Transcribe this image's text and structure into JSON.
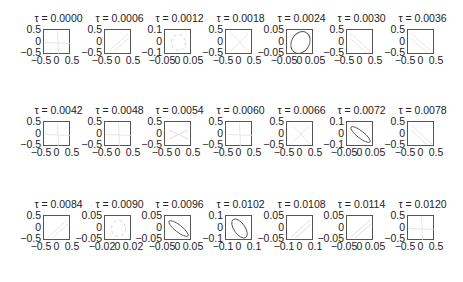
{
  "chart_data": {
    "type": "scatter",
    "layout": {
      "rows": 3,
      "cols": 7,
      "grid": false,
      "legend": "none"
    },
    "panels": [
      {
        "title": "τ = 0.0000",
        "xlim": [
          -0.5,
          0.5
        ],
        "ylim": [
          -0.5,
          0.5
        ],
        "xticks": [
          "−0.5",
          "0",
          "0.5"
        ],
        "yticks": [
          "0.5",
          "0",
          "−0.5"
        ],
        "shape": "faint-cross",
        "stroke": "#dddddd"
      },
      {
        "title": "τ = 0.0006",
        "xlim": [
          -0.5,
          0.5
        ],
        "ylim": [
          -0.5,
          0.5
        ],
        "xticks": [
          "−0.5",
          "0",
          "0.5"
        ],
        "yticks": [
          "0.5",
          "0",
          "−0.5"
        ],
        "shape": "faint-diagonal",
        "stroke": "#dddddd"
      },
      {
        "title": "τ = 0.0012",
        "xlim": [
          -0.05,
          0.05
        ],
        "ylim": [
          -0.1,
          0.1
        ],
        "xticks": [
          "−0.05",
          "0",
          "0.05"
        ],
        "yticks": [
          "0.1",
          "0",
          "−0.1"
        ],
        "shape": "faint-ring",
        "stroke": "#d0d0d0"
      },
      {
        "title": "τ = 0.0018",
        "xlim": [
          -0.5,
          0.5
        ],
        "ylim": [
          -0.5,
          0.5
        ],
        "xticks": [
          "−0.5",
          "0",
          "0.5"
        ],
        "yticks": [
          "0.5",
          "0",
          "−0.5"
        ],
        "shape": "faint-x",
        "stroke": "#dddddd"
      },
      {
        "title": "τ = 0.0024",
        "xlim": [
          -0.05,
          0.05
        ],
        "ylim": [
          -0.05,
          0.05
        ],
        "xticks": [
          "−0.05",
          "0",
          "0.05"
        ],
        "yticks": [
          "0.05",
          "0",
          "−0.05"
        ],
        "shape": "ellipse-tilt-right-large",
        "stroke": "#555555"
      },
      {
        "title": "τ = 0.0030",
        "xlim": [
          -0.5,
          0.5
        ],
        "ylim": [
          -0.5,
          0.5
        ],
        "xticks": [
          "−0.5",
          "0",
          "0.5"
        ],
        "yticks": [
          "0.5",
          "0",
          "−0.5"
        ],
        "shape": "faint-diagonal-down",
        "stroke": "#dddddd"
      },
      {
        "title": "τ = 0.0036",
        "xlim": [
          -0.5,
          0.5
        ],
        "ylim": [
          -0.5,
          0.5
        ],
        "xticks": [
          "−0.5",
          "0",
          "0.5"
        ],
        "yticks": [
          "0.5",
          "0",
          "−0.5"
        ],
        "shape": "faint-diagonal-down",
        "stroke": "#dddddd"
      },
      {
        "title": "τ = 0.0042",
        "xlim": [
          -0.5,
          0.5
        ],
        "ylim": [
          -0.5,
          0.5
        ],
        "xticks": [
          "−0.5",
          "0",
          "0.5"
        ],
        "yticks": [
          "0.5",
          "0",
          "−0.5"
        ],
        "shape": "faint-cross",
        "stroke": "#dddddd"
      },
      {
        "title": "τ = 0.0048",
        "xlim": [
          -0.5,
          0.5
        ],
        "ylim": [
          -0.5,
          0.5
        ],
        "xticks": [
          "−0.5",
          "0",
          "0.5"
        ],
        "yticks": [
          "0.5",
          "0",
          "−0.5"
        ],
        "shape": "faint-cross",
        "stroke": "#dddddd"
      },
      {
        "title": "τ = 0.0054",
        "xlim": [
          -0.5,
          0.5
        ],
        "ylim": [
          -0.5,
          0.5
        ],
        "xticks": [
          "−0.5",
          "0",
          "0.5"
        ],
        "yticks": [
          "0.5",
          "0",
          "−0.5"
        ],
        "shape": "faint-bowtie",
        "stroke": "#d0d0d0"
      },
      {
        "title": "τ = 0.0060",
        "xlim": [
          -0.5,
          0.5
        ],
        "ylim": [
          -0.5,
          0.5
        ],
        "xticks": [
          "−0.5",
          "0",
          "0.5"
        ],
        "yticks": [
          "0.5",
          "0",
          "−0.5"
        ],
        "shape": "faint-cross",
        "stroke": "#dddddd"
      },
      {
        "title": "τ = 0.0066",
        "xlim": [
          -0.5,
          0.5
        ],
        "ylim": [
          -0.5,
          0.5
        ],
        "xticks": [
          "−0.5",
          "0",
          "0.5"
        ],
        "yticks": [
          "0.5",
          "0",
          "−0.5"
        ],
        "shape": "faint-x",
        "stroke": "#dddddd"
      },
      {
        "title": "τ = 0.0072",
        "xlim": [
          -0.05,
          0.05
        ],
        "ylim": [
          -0.1,
          0.1
        ],
        "xticks": [
          "−0.05",
          "0",
          "0.05"
        ],
        "yticks": [
          "0.1",
          "0",
          "−0.1"
        ],
        "shape": "ellipse-tilt-left-thin",
        "stroke": "#555555"
      },
      {
        "title": "τ = 0.0078",
        "xlim": [
          -0.5,
          0.5
        ],
        "ylim": [
          -0.5,
          0.5
        ],
        "xticks": [
          "−0.5",
          "0",
          "0.5"
        ],
        "yticks": [
          "0.5",
          "0",
          "−0.5"
        ],
        "shape": "faint-diagonal-down",
        "stroke": "#dddddd"
      },
      {
        "title": "τ = 0.0084",
        "xlim": [
          -0.5,
          0.5
        ],
        "ylim": [
          -0.5,
          0.5
        ],
        "xticks": [
          "−0.5",
          "0",
          "0.5"
        ],
        "yticks": [
          "0.5",
          "0",
          "−0.5"
        ],
        "shape": "faint-diagonal",
        "stroke": "#dddddd"
      },
      {
        "title": "τ = 0.0090",
        "xlim": [
          -0.02,
          0.02
        ],
        "ylim": [
          -0.05,
          0.05
        ],
        "xticks": [
          "−0.02",
          "0",
          "0.02"
        ],
        "yticks": [
          "0.05",
          "0",
          "−0.05"
        ],
        "shape": "faint-ring",
        "stroke": "#d0d0d0"
      },
      {
        "title": "τ = 0.0096",
        "xlim": [
          -0.05,
          0.05
        ],
        "ylim": [
          -0.05,
          0.05
        ],
        "xticks": [
          "−0.05",
          "0",
          "0.05"
        ],
        "yticks": [
          "0.05",
          "0",
          "−0.05"
        ],
        "shape": "ellipse-tilt-left-thin",
        "stroke": "#555555"
      },
      {
        "title": "τ = 0.0102",
        "xlim": [
          -0.1,
          0.1
        ],
        "ylim": [
          -0.1,
          0.1
        ],
        "xticks": [
          "−0.1",
          "0",
          "0.1"
        ],
        "yticks": [
          "0.1",
          "0",
          "−0.1"
        ],
        "shape": "ellipse-tilt-left-medium",
        "stroke": "#555555"
      },
      {
        "title": "τ = 0.0108",
        "xlim": [
          -0.1,
          0.1
        ],
        "ylim": [
          -0.05,
          0.05
        ],
        "xticks": [
          "−0.1",
          "0",
          "0.1"
        ],
        "yticks": [
          "0.05",
          "0",
          "−0.05"
        ],
        "shape": "faint-diagonal",
        "stroke": "#d0d0d0"
      },
      {
        "title": "τ = 0.0114",
        "xlim": [
          -0.05,
          0.05
        ],
        "ylim": [
          -0.05,
          0.05
        ],
        "xticks": [
          "−0.05",
          "0",
          "0.05"
        ],
        "yticks": [
          "0.05",
          "0",
          "−0.05"
        ],
        "shape": "faint-diagonal",
        "stroke": "#d0d0d0"
      },
      {
        "title": "τ = 0.0120",
        "xlim": [
          -0.5,
          0.5
        ],
        "ylim": [
          -0.5,
          0.5
        ],
        "xticks": [
          "−0.5",
          "0",
          "0.5"
        ],
        "yticks": [
          "0.5",
          "0",
          "−0.5"
        ],
        "shape": "faint-cross",
        "stroke": "#dddddd"
      }
    ]
  },
  "colors": {
    "axis": "#555555",
    "text": "#222222",
    "faint": "#dddddd",
    "curve": "#555555"
  }
}
